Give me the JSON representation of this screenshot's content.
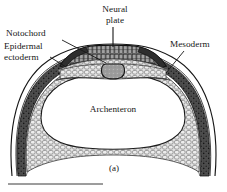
{
  "figure": {
    "panel_label": "(a)",
    "caption_rule": true,
    "background": "#ffffff",
    "ink": "#161616"
  },
  "labels": {
    "neural_plate": "Neural\nplate",
    "notochord": "Notochord",
    "epidermal_ectoderm": "Epidermal\nectoderm",
    "mesoderm": "Mesoderm",
    "archenteron": "Archenteron"
  },
  "structures": [
    {
      "name": "neural-plate",
      "label": "Neural plate",
      "fill": "#8d8d8d"
    },
    {
      "name": "notochord",
      "label": "Notochord",
      "fill": "#9a9a9a"
    },
    {
      "name": "epidermal-ectoderm",
      "label": "Epidermal ectoderm",
      "fill": "#f2f2f2"
    },
    {
      "name": "mesoderm",
      "label": "Mesoderm",
      "fill": "#4a4a4a"
    },
    {
      "name": "endoderm",
      "label": "Endoderm",
      "fill": "#d8d8d8"
    },
    {
      "name": "archenteron",
      "label": "Archenteron",
      "fill": "#ffffff"
    }
  ],
  "colors": {
    "outline": "#161616",
    "mesoderm_dark": "#4e4e4e",
    "endoderm_light": "#dcdcdc",
    "neural_plate_gray": "#8a8a8a",
    "notochord_gray": "#9c9c9c"
  }
}
